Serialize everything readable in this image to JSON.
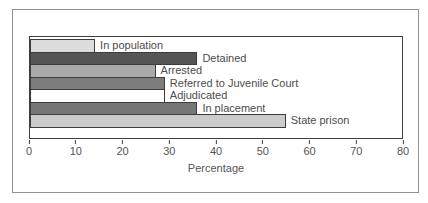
{
  "figure": {
    "background_color": "#ffffff",
    "outer_border_color": "#919191",
    "plot_border_color": "#3f3f3f",
    "text_color": "#4d4d4d"
  },
  "chart_data": {
    "type": "bar",
    "orientation": "horizontal",
    "title": "",
    "categories": [
      "In population",
      "Detained",
      "Arrested",
      "Referred to Juvenile Court",
      "Adjudicated",
      "In placement",
      "State prison"
    ],
    "values": [
      14,
      36,
      27,
      29,
      29,
      36,
      55
    ],
    "bar_colors": [
      "#dcdcdc",
      "#565656",
      "#a9a9a9",
      "#7d7d7d",
      "#ffffff",
      "#777777",
      "#cbcbcb"
    ],
    "bar_border_color": "#3c3c3c",
    "value_labels_position": "right-of-bar",
    "xlabel": "Percentage",
    "ylabel": "",
    "xlim": [
      0,
      80
    ],
    "xticks": [
      0,
      10,
      20,
      30,
      40,
      50,
      60,
      70,
      80
    ],
    "grid": false,
    "legend": false
  }
}
